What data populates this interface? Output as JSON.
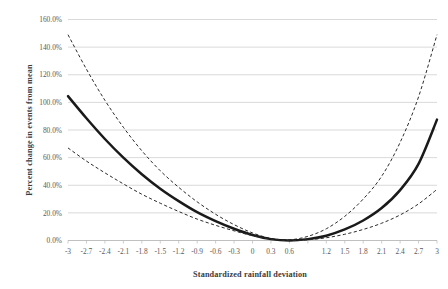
{
  "chart_data": {
    "type": "line",
    "title": "",
    "subtitle": "",
    "xlabel": "Standardized rainfall deviation",
    "ylabel": "Percent change in events from mean",
    "xlim": [
      -3,
      3
    ],
    "ylim": [
      0,
      160
    ],
    "grid": "horizontal",
    "legend": "none",
    "y_tick_labels": [
      "0.0%",
      "20.0%",
      "40.0%",
      "60.0%",
      "80.0%",
      "100.0%",
      "120.0%",
      "140.0%",
      "160.0%"
    ],
    "y_tick_values": [
      0,
      20,
      40,
      60,
      80,
      100,
      120,
      140,
      160
    ],
    "x_tick_labels": [
      "-3",
      "-2.7",
      "-2.4",
      "-2.1",
      "-1.8",
      "-1.5",
      "-1.2",
      "-0.9",
      "-0.6",
      "-0.3",
      "0",
      "0.3",
      "0.6",
      "",
      "1.2",
      "1.5",
      "1.8",
      "2.1",
      "2.4",
      "2.7",
      "3"
    ],
    "x_tick_values": [
      -3,
      -2.7,
      -2.4,
      -2.1,
      -1.8,
      -1.5,
      -1.2,
      -0.9,
      -0.6,
      -0.3,
      0,
      0.3,
      0.6,
      0.9,
      1.2,
      1.5,
      1.8,
      2.1,
      2.4,
      2.7,
      3
    ],
    "x": [
      -3,
      -2.7,
      -2.4,
      -2.1,
      -1.8,
      -1.5,
      -1.2,
      -0.9,
      -0.6,
      -0.3,
      0,
      0.3,
      0.6,
      0.9,
      1.2,
      1.5,
      1.8,
      2.1,
      2.4,
      2.7,
      3
    ],
    "series": [
      {
        "name": "Upper confidence bound",
        "style": "dashed",
        "color": "#2b2b2b",
        "values": [
          149.0,
          124.0,
          101.5,
          82.0,
          65.0,
          50.5,
          38.5,
          28.0,
          19.0,
          11.5,
          5.5,
          1.5,
          0.5,
          3.0,
          8.5,
          17.5,
          30.0,
          46.5,
          71.0,
          104.0,
          149.0
        ]
      },
      {
        "name": "Predicted percent change",
        "style": "solid",
        "color": "#1a1a1a",
        "values": [
          104.5,
          88.5,
          73.5,
          60.0,
          48.0,
          37.5,
          28.5,
          20.5,
          14.0,
          8.5,
          4.0,
          1.0,
          0.0,
          1.0,
          3.5,
          8.0,
          14.5,
          23.5,
          36.5,
          55.5,
          87.5
        ]
      },
      {
        "name": "Lower confidence bound",
        "style": "dashed",
        "color": "#2b2b2b",
        "values": [
          67.0,
          57.5,
          49.0,
          41.0,
          33.5,
          27.0,
          21.0,
          15.5,
          11.0,
          7.0,
          3.5,
          1.0,
          0.0,
          0.5,
          2.0,
          4.5,
          8.0,
          12.5,
          18.5,
          26.5,
          37.0
        ]
      }
    ]
  }
}
